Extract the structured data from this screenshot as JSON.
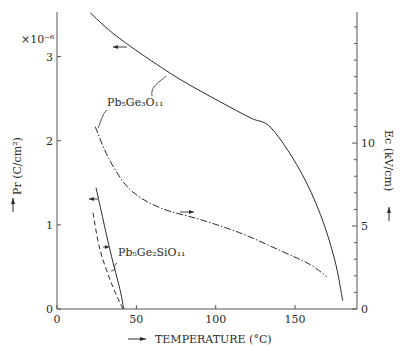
{
  "chart_data": {
    "type": "line",
    "title": "",
    "xlabel": "TEMPERATURE (°C)",
    "ylabel_left": "Pr (C/cm²)",
    "ylabel_right": "Ec (kV/cm)",
    "left_multiplier": "×10⁻⁶",
    "xlim": [
      0,
      189
    ],
    "ylim_left": [
      0,
      3.53
    ],
    "ylim_right": [
      0,
      17.9
    ],
    "x_ticks": [
      0,
      50,
      100,
      150
    ],
    "y_left_ticks": [
      0,
      1,
      2,
      3
    ],
    "y_right_ticks": [
      0,
      5,
      10
    ],
    "y_right_minor_step": 1,
    "grid": false,
    "annotations": [
      "Pb₅Ge₃O₁₁",
      "Pb₅Ge₂SiO₁₁"
    ],
    "series": [
      {
        "name": "Pb5Ge3O11 Pr",
        "axis": "left",
        "style": "solid",
        "x": [
          21,
          35,
          54,
          77.5,
          103,
          122,
          135,
          153,
          166,
          175,
          180
        ],
        "y": [
          3.52,
          3.28,
          3.02,
          2.73,
          2.46,
          2.27,
          2.15,
          1.65,
          1.12,
          0.58,
          0.1
        ]
      },
      {
        "name": "Pb5Ge3O11 Ec",
        "axis": "right",
        "style": "dashdot",
        "x": [
          24,
          33,
          46,
          65,
          90,
          115,
          140,
          159,
          170
        ],
        "y": [
          11.0,
          9.0,
          7.2,
          6.1,
          5.4,
          4.6,
          3.55,
          2.7,
          1.95
        ]
      },
      {
        "name": "Pb5Ge2SiO11 Pr",
        "axis": "left",
        "style": "solid",
        "x": [
          24.6,
          33.4,
          39.7,
          42
        ],
        "y": [
          1.44,
          0.7,
          0.23,
          0
        ]
      },
      {
        "name": "Pb5Ge2SiO11 Ec",
        "axis": "right",
        "style": "dashed",
        "x": [
          22.7,
          27,
          34.7,
          41.6
        ],
        "y": [
          5.8,
          3.6,
          1.45,
          0
        ]
      }
    ]
  }
}
